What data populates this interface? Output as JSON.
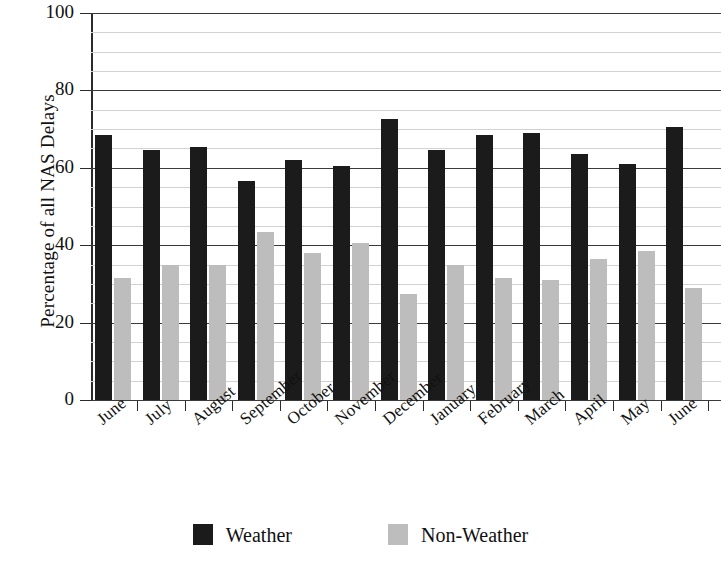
{
  "chart_data": {
    "type": "bar",
    "title": "",
    "xlabel": "",
    "ylabel": "Percentage of all NAS Delays",
    "ylim": [
      0,
      100
    ],
    "ytick_labels": [
      "0",
      "20",
      "40",
      "60",
      "80",
      "100"
    ],
    "ytick_values": [
      0,
      20,
      40,
      60,
      80,
      100
    ],
    "minor_gridline_step": 5,
    "grid": true,
    "legend_position": "bottom-center",
    "categories": [
      "June",
      "July",
      "August",
      "September",
      "October",
      "November",
      "December",
      "January",
      "February",
      "March",
      "April",
      "May",
      "June"
    ],
    "series": [
      {
        "name": "Weather",
        "color": "#1b1b1b",
        "values": [
          68.5,
          64.5,
          65.5,
          56.5,
          62.0,
          60.5,
          72.5,
          64.5,
          68.5,
          69.0,
          63.5,
          61.0,
          70.5
        ]
      },
      {
        "name": "Non-Weather",
        "color": "#bdbdbd",
        "values": [
          31.5,
          35.0,
          35.0,
          43.5,
          38.0,
          40.5,
          27.5,
          35.0,
          31.5,
          31.0,
          36.5,
          38.5,
          29.0
        ]
      }
    ]
  },
  "legend": {
    "items": [
      {
        "label": "Weather",
        "color": "#1b1b1b"
      },
      {
        "label": "Non-Weather",
        "color": "#bdbdbd"
      }
    ]
  }
}
